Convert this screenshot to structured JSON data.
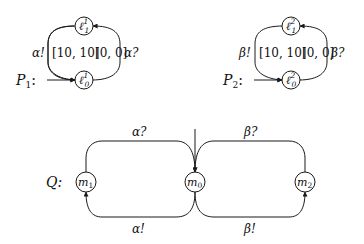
{
  "diagram": {
    "type": "timed-automata",
    "automata": [
      {
        "id": "P1",
        "name_label": "P",
        "name_sub": "1",
        "name_suffix": ":",
        "states": [
          {
            "id": "l1_1",
            "base": "ℓ",
            "sup": "1",
            "sub": "1"
          },
          {
            "id": "l0_1",
            "base": "ℓ",
            "sup": "1",
            "sub": "0",
            "initial": true
          }
        ],
        "edges": [
          {
            "from": "l0_1",
            "to": "l1_1",
            "label": "α!",
            "interval": "[10, 10]"
          },
          {
            "from": "l1_1",
            "to": "l0_1",
            "label": "α?",
            "interval": "[0, 0]"
          }
        ]
      },
      {
        "id": "P2",
        "name_label": "P",
        "name_sub": "2",
        "name_suffix": ":",
        "states": [
          {
            "id": "l1_2",
            "base": "ℓ",
            "sup": "2",
            "sub": "1"
          },
          {
            "id": "l0_2",
            "base": "ℓ",
            "sup": "2",
            "sub": "0",
            "initial": true
          }
        ],
        "edges": [
          {
            "from": "l0_2",
            "to": "l1_2",
            "label": "β!",
            "interval": "[10, 10]"
          },
          {
            "from": "l1_2",
            "to": "l0_2",
            "label": "β?",
            "interval": "[0, 0]"
          }
        ]
      },
      {
        "id": "Q",
        "name_label": "Q",
        "name_suffix": ":",
        "states": [
          {
            "id": "m1",
            "base": "m",
            "sub": "1"
          },
          {
            "id": "m0",
            "base": "m",
            "sub": "0",
            "initial": true
          },
          {
            "id": "m2",
            "base": "m",
            "sub": "2"
          }
        ],
        "edges": [
          {
            "from": "m1",
            "to": "m0",
            "label": "α?"
          },
          {
            "from": "m0",
            "to": "m1",
            "label": "α!"
          },
          {
            "from": "m2",
            "to": "m0",
            "label": "β?"
          },
          {
            "from": "m0",
            "to": "m2",
            "label": "β!"
          }
        ]
      }
    ]
  },
  "labels": {
    "p1_name": "P",
    "p1_sub": "1",
    "p1_colon": ":",
    "p1_left_edge": "α!",
    "p1_left_interval": "[10, 10]",
    "p1_right_interval": "[0, 0]",
    "p1_right_edge": "α?",
    "p1_top_node": "ℓ",
    "p1_top_sup": "1",
    "p1_top_sub": "1",
    "p1_bot_node": "ℓ",
    "p1_bot_sup": "1",
    "p1_bot_sub": "0",
    "p2_name": "P",
    "p2_sub": "2",
    "p2_colon": ":",
    "p2_left_edge": "β!",
    "p2_left_interval": "[10, 10]",
    "p2_right_interval": "[0, 0]",
    "p2_right_edge": "β?",
    "p2_top_node": "ℓ",
    "p2_top_sup": "2",
    "p2_top_sub": "1",
    "p2_bot_node": "ℓ",
    "p2_bot_sup": "2",
    "p2_bot_sub": "0",
    "q_name": "Q:",
    "m1": "m",
    "m1_sub": "1",
    "m0": "m",
    "m0_sub": "0",
    "m2": "m",
    "m2_sub": "2",
    "q_top_left": "α?",
    "q_bottom_left": "α!",
    "q_top_right": "β?",
    "q_bottom_right": "β!"
  }
}
